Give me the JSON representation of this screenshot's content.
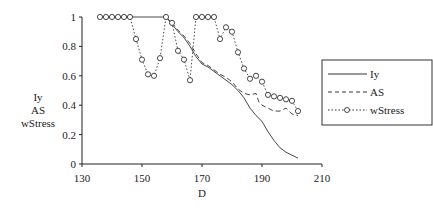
{
  "chart_data": {
    "type": "line",
    "title": "",
    "xlabel": "D",
    "ylabel_lines": [
      "Iy",
      "AS",
      "wStress"
    ],
    "xlim": [
      130,
      210
    ],
    "ylim": [
      0,
      1
    ],
    "xticks": [
      130,
      150,
      170,
      190,
      210
    ],
    "yticks": [
      0,
      0.2,
      0.4,
      0.6,
      0.8,
      1
    ],
    "ytick_labels": [
      "0",
      "0.2",
      "0.4",
      "0.6",
      "0.8",
      "1"
    ],
    "grid": false,
    "legend_position": "right",
    "series": [
      {
        "name": "Iy",
        "style": "solid",
        "x": [
          136,
          158,
          160,
          162,
          164,
          166,
          168,
          170,
          172,
          174,
          176,
          178,
          180,
          182,
          184,
          186,
          188,
          190,
          192,
          194,
          196,
          198,
          200,
          202
        ],
        "y": [
          1,
          1,
          0.95,
          0.9,
          0.86,
          0.8,
          0.73,
          0.68,
          0.66,
          0.63,
          0.6,
          0.57,
          0.54,
          0.5,
          0.45,
          0.38,
          0.33,
          0.29,
          0.22,
          0.16,
          0.11,
          0.08,
          0.06,
          0.04
        ]
      },
      {
        "name": "AS",
        "style": "dashed",
        "x": [
          158,
          160,
          162,
          164,
          166,
          168,
          170,
          172,
          174,
          176,
          178,
          180,
          182,
          184,
          186,
          188,
          189,
          190,
          192,
          194,
          196,
          198,
          200,
          202
        ],
        "y": [
          1,
          0.96,
          0.91,
          0.87,
          0.82,
          0.75,
          0.69,
          0.67,
          0.64,
          0.61,
          0.59,
          0.56,
          0.51,
          0.48,
          0.47,
          0.48,
          0.42,
          0.4,
          0.38,
          0.36,
          0.36,
          0.38,
          0.34,
          0.33
        ]
      },
      {
        "name": "wStress",
        "style": "dotted-circle-markers",
        "x": [
          136,
          138,
          140,
          142,
          144,
          146,
          148,
          150,
          152,
          154,
          156,
          158,
          160,
          162,
          164,
          166,
          168,
          170,
          172,
          174,
          176,
          178,
          180,
          182,
          184,
          186,
          188,
          190,
          192,
          194,
          196,
          198,
          200,
          202
        ],
        "y": [
          1,
          1,
          1,
          1,
          1,
          1,
          0.85,
          0.71,
          0.61,
          0.6,
          0.72,
          1,
          0.96,
          0.77,
          0.71,
          0.57,
          1,
          1,
          1,
          1,
          0.85,
          0.93,
          0.9,
          0.76,
          0.65,
          0.58,
          0.6,
          0.56,
          0.47,
          0.46,
          0.45,
          0.44,
          0.43,
          0.36
        ]
      }
    ]
  },
  "legend": {
    "items": [
      {
        "label": "Iy",
        "style": "solid"
      },
      {
        "label": "AS",
        "style": "dashed"
      },
      {
        "label": "wStress",
        "style": "dotted-circle"
      }
    ]
  },
  "axes": {
    "xlabel": "D",
    "ylabel_line1": "Iy",
    "ylabel_line2": "AS",
    "ylabel_line3": "wStress",
    "xtick_labels": [
      "130",
      "150",
      "170",
      "190",
      "210"
    ],
    "ytick_labels": [
      "0",
      "0.2",
      "0.4",
      "0.6",
      "0.8",
      "1"
    ]
  },
  "colors": {
    "line": "#333333",
    "axis": "#222222",
    "background": "#ffffff"
  }
}
